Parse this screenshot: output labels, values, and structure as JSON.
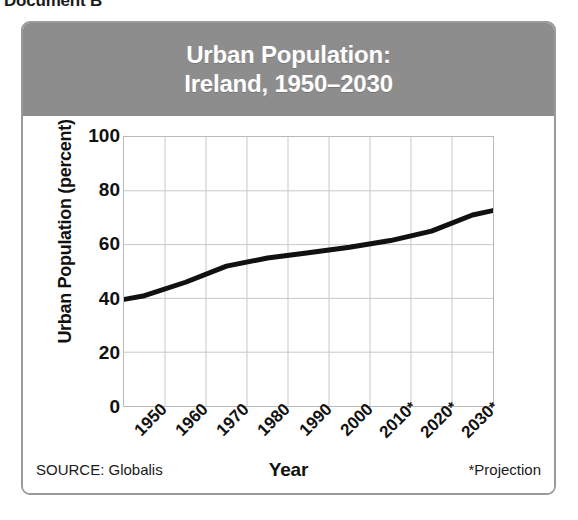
{
  "document_label": "Document B",
  "card": {
    "title_lines": [
      "Urban Population:",
      "Ireland, 1950–2030"
    ],
    "banner_color": "#8d8d8d",
    "border_color": "#9a9a9a"
  },
  "footer": {
    "source": "SOURCE: Globalis",
    "x_axis_label": "Year",
    "projection_note": "*Projection"
  },
  "chart_data": {
    "type": "line",
    "title": "Urban Population: Ireland, 1950–2030",
    "xlabel": "Year",
    "ylabel": "Urban Population (percent)",
    "categories": [
      "1950",
      "1960",
      "1970",
      "1980",
      "1990",
      "2000",
      "2010*",
      "2020*",
      "2030*"
    ],
    "x": [
      1950,
      1960,
      1970,
      1980,
      1990,
      2000,
      2010,
      2020,
      2030
    ],
    "values": [
      41,
      46,
      52,
      55,
      57,
      59,
      61.5,
      65,
      71
    ],
    "y_ticks": [
      0,
      20,
      40,
      60,
      80,
      100
    ],
    "ylim": [
      0,
      100
    ],
    "x_tick_labels": [
      "1950",
      "1960",
      "1970",
      "1980",
      "1990",
      "2000",
      "2010*",
      "2020*",
      "2030*"
    ],
    "grid": true,
    "legend": null,
    "line_color": "#111111",
    "line_width": 5,
    "projected_points": [
      "2010*",
      "2020*",
      "2030*"
    ],
    "annotations": [
      "*Projection",
      "SOURCE: Globalis"
    ]
  }
}
